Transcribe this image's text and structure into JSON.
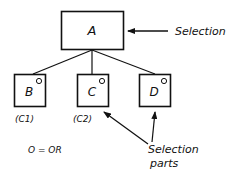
{
  "diagram": {
    "root": {
      "label": "A",
      "annotation": "Selection"
    },
    "children": [
      {
        "label": "B",
        "sub": "(C1)"
      },
      {
        "label": "C",
        "sub": "(C2)"
      },
      {
        "label": "D",
        "sub": ""
      }
    ],
    "legend": "O = OR",
    "parts_annotation": {
      "line1": "Selection",
      "line2": "parts"
    }
  }
}
